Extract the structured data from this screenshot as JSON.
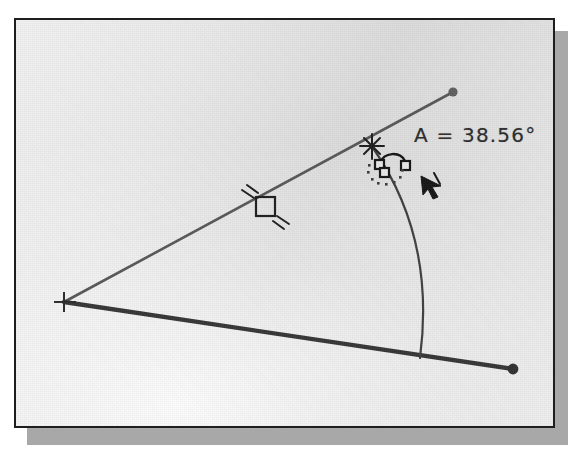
{
  "app": {
    "title": "CAD Angle Dimension View",
    "panel_name": "drawing-canvas"
  },
  "drawing": {
    "angle_label": "A = 38.56°",
    "angle_value": 38.56,
    "angle_unit": "degrees",
    "angle_variable": "A",
    "colors": {
      "line_primary": "#3c3c3c",
      "line_secondary": "#5a5a5a",
      "arc": "#3f3f3f",
      "marker": "#1a1a1a",
      "panel_border": "#1e1e1e",
      "panel_shadow": "#a8a8a8",
      "label_text": "#2b2b2b",
      "canvas_base": "#e4e4e4"
    },
    "entities": [
      {
        "name": "upper-ray",
        "type": "line",
        "from": [
          48,
          282
        ],
        "to": [
          437,
          72
        ],
        "weight": "thin",
        "endpoint_marker": "round-dot"
      },
      {
        "name": "lower-ray",
        "type": "line",
        "from": [
          48,
          282
        ],
        "to": [
          497,
          349
        ],
        "weight": "thick",
        "endpoint_marker": "round-dot"
      },
      {
        "name": "angle-arc",
        "type": "arc",
        "from": [
          357,
          128
        ],
        "to": [
          405,
          338
        ],
        "bulge_x": 424
      }
    ],
    "markers": [
      {
        "name": "vertex-cross-marker",
        "type": "cross",
        "at": [
          48,
          282
        ]
      },
      {
        "name": "parallel-constraint-marker",
        "type": "square-with-ticks",
        "at": [
          249,
          186
        ]
      },
      {
        "name": "snap-point-marker",
        "type": "asterisk-snap",
        "at": [
          356,
          126
        ]
      },
      {
        "name": "rotate-grip-icon",
        "type": "two-squares-with-arc",
        "at": [
          375,
          146
        ]
      },
      {
        "name": "dotted-selection-circle",
        "type": "dotted-circle",
        "at": [
          369,
          155
        ]
      },
      {
        "name": "mouse-cursor-arrow",
        "type": "arrow-pointer",
        "at": [
          417,
          163
        ]
      }
    ]
  }
}
